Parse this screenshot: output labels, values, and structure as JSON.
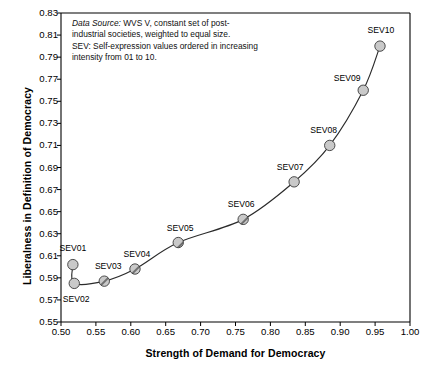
{
  "chart_data": {
    "type": "scatter",
    "title": "",
    "xlabel": "Strength of Demand for Democracy",
    "ylabel": "Liberalness in Definition of Democracy",
    "xlim": [
      0.5,
      1.0
    ],
    "ylim": [
      0.55,
      0.83
    ],
    "xticks": [
      "0.50",
      "0.55",
      "0.60",
      "0.65",
      "0.70",
      "0.75",
      "0.80",
      "0.85",
      "0.90",
      "0.95",
      "1.00"
    ],
    "yticks": [
      "0.55",
      "0.57",
      "0.59",
      "0.61",
      "0.63",
      "0.65",
      "0.67",
      "0.69",
      "0.71",
      "0.73",
      "0.75",
      "0.77",
      "0.79",
      "0.81",
      "0.83"
    ],
    "grid": false,
    "legend": "none",
    "connected": true,
    "marker_color": "#c9c9c9",
    "marker_edge_color": "#3a3a3a",
    "line_color": "#2b2b2b",
    "points": [
      {
        "label": "SEV01",
        "x": 0.517,
        "y": 0.602,
        "label_dx": 0,
        "label_dy": -17,
        "hatched": false
      },
      {
        "label": "SEV02",
        "x": 0.519,
        "y": 0.585,
        "label_dx": 2,
        "label_dy": 16,
        "hatched": false
      },
      {
        "label": "SEV03",
        "x": 0.562,
        "y": 0.587,
        "label_dx": 4,
        "label_dy": -15,
        "hatched": true
      },
      {
        "label": "SEV04",
        "x": 0.606,
        "y": 0.598,
        "label_dx": 2,
        "label_dy": -15,
        "hatched": true
      },
      {
        "label": "SEV05",
        "x": 0.668,
        "y": 0.622,
        "label_dx": 2,
        "label_dy": -15,
        "hatched": true
      },
      {
        "label": "SEV06",
        "x": 0.761,
        "y": 0.643,
        "label_dx": -2,
        "label_dy": -15,
        "hatched": true
      },
      {
        "label": "SEV07",
        "x": 0.834,
        "y": 0.677,
        "label_dx": -4,
        "label_dy": -15,
        "hatched": true
      },
      {
        "label": "SEV08",
        "x": 0.885,
        "y": 0.71,
        "label_dx": -6,
        "label_dy": -15,
        "hatched": true
      },
      {
        "label": "SEV09",
        "x": 0.933,
        "y": 0.76,
        "label_dx": -16,
        "label_dy": -12,
        "hatched": true
      },
      {
        "label": "SEV10",
        "x": 0.957,
        "y": 0.8,
        "label_dx": 1,
        "label_dy": -16,
        "hatched": false
      }
    ],
    "annotation": {
      "line1_italic": "Data Source:",
      "line1_rest": " WVS V, constant set of post-",
      "line2": "industrial societies, weighted to equal size.",
      "line3": "SEV: Self-expression values ordered in increasing",
      "line4": "intensity from 01 to 10."
    }
  }
}
